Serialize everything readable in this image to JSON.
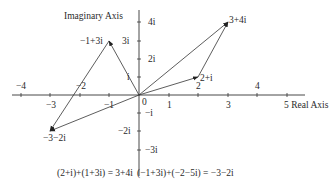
{
  "diagram": {
    "axes": {
      "x_label": "Real Axis",
      "y_label": "Imaginary Axis",
      "x_ticks_above": [
        "-4",
        "-2",
        "2",
        "4"
      ],
      "x_ticks_below": [
        "-3",
        "-1",
        "1",
        "3",
        "5"
      ],
      "origin_label": "0",
      "y_ticks_right": [
        "4i",
        "2i",
        "-i",
        "-3i"
      ],
      "y_ticks_left": [
        "3i",
        "i",
        "-2i"
      ]
    },
    "points": [
      {
        "label": "3+4i",
        "re": 3,
        "im": 4
      },
      {
        "label": "2+i",
        "re": 2,
        "im": 1
      },
      {
        "label": "-1+3i",
        "re": -1,
        "im": 3
      },
      {
        "label": "-3-2i",
        "re": -3,
        "im": -2
      }
    ],
    "equations": [
      "(2+i)+(1+3i) = 3+4i",
      "(−1+3i)+(−2−5i) = −3−2i"
    ]
  },
  "labels": {
    "x_axis": "5 Real Axis",
    "y_axis": "Imaginary Axis",
    "tick_m4": "−4",
    "tick_m2": "−2",
    "tick_2": "2",
    "tick_4": "4",
    "tick_m3": "−3",
    "tick_m1": "−1",
    "tick_1": "1",
    "tick_3": "3",
    "origin": "0",
    "y_4i": "4i",
    "y_3i": "3i",
    "y_2i": "2i",
    "y_i": "i",
    "y_mi": "−i",
    "y_m2i": "−2i",
    "y_m3i": "−3i",
    "pt_3p4i": "3+4i",
    "pt_2pi": "2+i",
    "pt_m1p3i": "−1+3i",
    "pt_m3m2i": "−3−2i",
    "eq1": "(2+i)+(1+3i) = 3+4i",
    "eq2": "(−1+3i)+(−2−5i) = −3−2i"
  }
}
